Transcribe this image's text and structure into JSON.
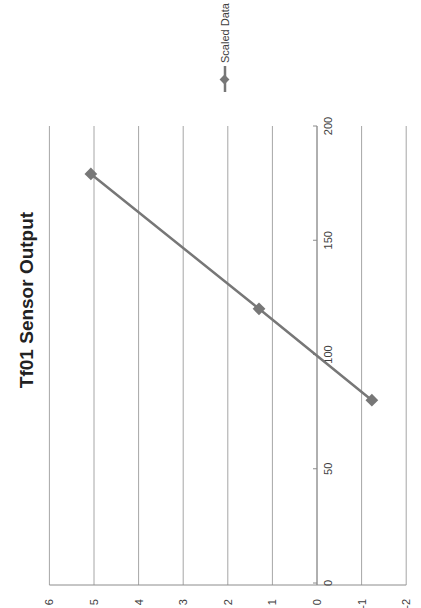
{
  "chart_data": {
    "type": "line",
    "title": "Tf01 Sensor Output",
    "orientation": "rotated 90 degrees counter-clockwise",
    "xlabel": "",
    "ylabel": "",
    "xlim": [
      0,
      200
    ],
    "ylim": [
      -2,
      6
    ],
    "x_ticks": [
      0,
      50,
      100,
      150,
      200
    ],
    "y_ticks": [
      6,
      5,
      4,
      3,
      2,
      1,
      0,
      -1,
      -2
    ],
    "x_tick_labels": [
      "0",
      "50",
      "100",
      "150",
      "200"
    ],
    "y_tick_labels": [
      "6",
      "5",
      "4",
      "3",
      "2",
      "1",
      "0",
      "-1",
      "-2"
    ],
    "grid": true,
    "legend_position": "right",
    "series": [
      {
        "name": "Scaled Data",
        "color": "#777777",
        "marker": "diamond",
        "x": [
          80,
          120,
          179
        ],
        "y": [
          -1.23,
          1.3,
          5.07
        ]
      }
    ]
  },
  "legend": {
    "label": "Scaled Data"
  },
  "colors": {
    "series": "#777777",
    "grid": "#a6a6a6",
    "axis": "#8c8c8c"
  }
}
